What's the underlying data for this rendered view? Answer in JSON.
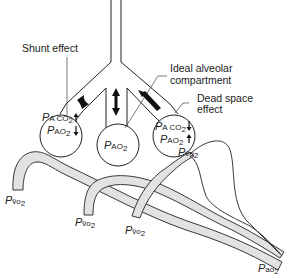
{
  "diagram": {
    "labels": {
      "shunt_effect": "Shunt effect",
      "ideal_alveolar_line1": "Ideal alveolar",
      "ideal_alveolar_line2": "compartment",
      "dead_space_line1": "Dead space",
      "dead_space_line2": "effect"
    },
    "alveoli": [
      {
        "name": "shunt",
        "lines": [
          {
            "P": "P",
            "sub": "A CO",
            "sub2": "2",
            "arrow": "up"
          },
          {
            "P": "P",
            "sub": "AO",
            "sub2": "2",
            "arrow": "down"
          }
        ]
      },
      {
        "name": "ideal",
        "lines": [
          {
            "P": "P",
            "sub": "AO",
            "sub2": "2"
          }
        ]
      },
      {
        "name": "dead-space",
        "lines": [
          {
            "P": "P",
            "sub": "A CO",
            "sub2": "2",
            "arrow": "down"
          },
          {
            "P": "P",
            "sub": "AO",
            "sub2": "2",
            "arrow": "up"
          }
        ]
      }
    ],
    "vessel_labels": {
      "venous_1": {
        "P": "P",
        "sub": "v̄o",
        "sub2": "2"
      },
      "venous_2": {
        "P": "P",
        "sub": "v̄o",
        "sub2": "2"
      },
      "venous_3": {
        "P": "P",
        "sub": "v̄o",
        "sub2": "2"
      },
      "venous_4": {
        "P": "P",
        "sub": "v̄o",
        "sub2": "2"
      },
      "arterial": {
        "P": "P",
        "sub": "ao",
        "sub2": "2"
      }
    },
    "colors": {
      "line": "#222222",
      "vessel_fill": "#e2e2e2",
      "background": "#ffffff"
    }
  }
}
